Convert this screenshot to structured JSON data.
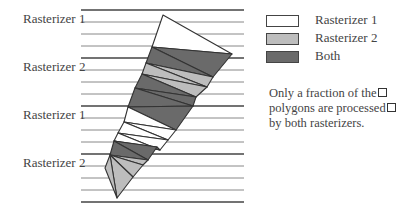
{
  "diagram": {
    "row_labels": [
      "Rasterizer 1",
      "Rasterizer 2",
      "Rasterizer 1",
      "Rasterizer 2"
    ],
    "legend": [
      {
        "label": "Rasterizer 1",
        "color": "#ffffff"
      },
      {
        "label": "Rasterizer 2",
        "color": "#bdbdbd"
      },
      {
        "label": "Both",
        "color": "#6a6a6a"
      }
    ],
    "note_lines": [
      "Only a fraction of the",
      "polygons are processed",
      "by both rasterizers."
    ],
    "colors": {
      "line": "#555555",
      "outline": "#333333",
      "rasterizer1": "#ffffff",
      "rasterizer2": "#bdbdbd",
      "both": "#6a6a6a"
    }
  }
}
